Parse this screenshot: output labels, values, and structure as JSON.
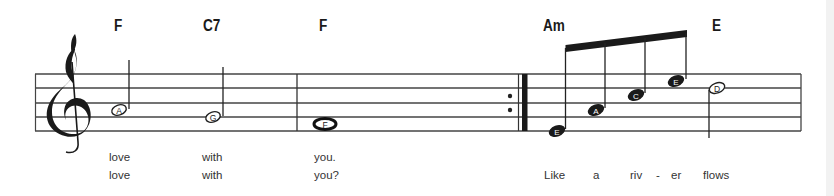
{
  "score": {
    "clef": "treble-clef",
    "chords": [
      {
        "label": "F",
        "x": 114
      },
      {
        "label": "C7",
        "x": 203
      },
      {
        "label": "F",
        "x": 319
      },
      {
        "label": "Am",
        "x": 543
      },
      {
        "label": "E",
        "x": 712
      }
    ],
    "notes": [
      {
        "name": "A",
        "type": "half",
        "stem": "up"
      },
      {
        "name": "G",
        "type": "half",
        "stem": "up"
      },
      {
        "name": "F",
        "type": "whole",
        "stem": "none"
      },
      {
        "name": "E",
        "type": "eighth",
        "stem": "up"
      },
      {
        "name": "A",
        "type": "eighth",
        "stem": "up"
      },
      {
        "name": "C",
        "type": "eighth",
        "stem": "up"
      },
      {
        "name": "E",
        "type": "eighth",
        "stem": "up"
      },
      {
        "name": "D",
        "type": "half",
        "stem": "down"
      }
    ],
    "barlines": [
      "single",
      "repeat-end",
      "final-right"
    ],
    "lyrics": {
      "verse1": [
        "love",
        "with",
        "you."
      ],
      "verse2": [
        "love",
        "with",
        "you?"
      ],
      "line2": [
        "Like",
        "a",
        "riv",
        "-",
        "er",
        "flows"
      ]
    }
  }
}
